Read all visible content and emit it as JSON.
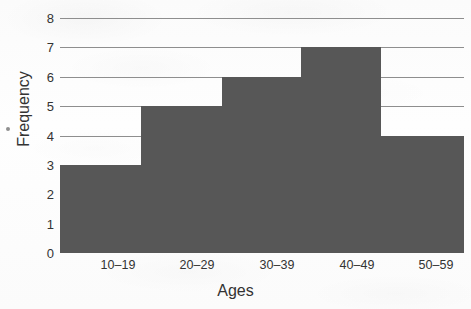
{
  "chart_data": {
    "type": "bar",
    "title": "",
    "subtitle": "",
    "xlabel": "Ages",
    "ylabel": "Frequency",
    "categories": [
      "10–19",
      "20–29",
      "30–39",
      "40–49",
      "50–59"
    ],
    "values": [
      3,
      5,
      6,
      7,
      4
    ],
    "series": [
      {
        "name": "Frequency",
        "values": [
          3,
          5,
          6,
          7,
          4
        ]
      }
    ],
    "ylim": [
      0,
      8
    ],
    "y_ticks": [
      0,
      1,
      2,
      3,
      4,
      5,
      6,
      7,
      8
    ],
    "y_tick_labels": [
      "0",
      "1",
      "2",
      "3",
      "4",
      "5",
      "6",
      "7",
      "8"
    ],
    "gridlines_visible_at": [
      4,
      5,
      6,
      7,
      8
    ],
    "grid": true,
    "legend": "none",
    "legend_position": "none",
    "bar_style": "histogram-contiguous",
    "annotations": [],
    "colors": {
      "bar_fill": "#575757",
      "gridline": "#8e8e8e",
      "text": "#333333",
      "background": "#fdfdfd"
    },
    "bins": [
      {
        "label": "10–19",
        "frequency": 3,
        "step_start_px": 60,
        "step_end_px": 141
      },
      {
        "label": "20–29",
        "frequency": 5,
        "step_start_px": 141,
        "step_end_px": 222
      },
      {
        "label": "30–39",
        "frequency": 6,
        "step_start_px": 222,
        "step_end_px": 301
      },
      {
        "label": "40–49",
        "frequency": 7,
        "step_start_px": 301,
        "step_end_px": 381
      },
      {
        "label": "50–59",
        "frequency": 4,
        "step_start_px": 381,
        "step_end_px": 464
      }
    ],
    "tick_centers_px": [
      118,
      197,
      277,
      357,
      436
    ]
  }
}
